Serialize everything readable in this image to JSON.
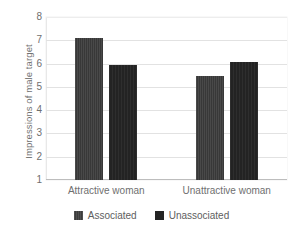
{
  "chart_data": {
    "type": "bar",
    "title": "",
    "xlabel": "",
    "ylabel": "Impressions of male target",
    "categories": [
      "Attractive woman",
      "Unattractive woman"
    ],
    "series": [
      {
        "name": "Associated",
        "values": [
          7.1,
          5.45
        ],
        "color": "#383838"
      },
      {
        "name": "Unassociated",
        "values": [
          5.95,
          6.05
        ],
        "color": "#232323"
      }
    ],
    "ylim": [
      1,
      8
    ],
    "yticks": [
      1,
      2,
      3,
      4,
      5,
      6,
      7,
      8
    ],
    "ytick_labels": [
      "1",
      "2",
      "3",
      "4",
      "5",
      "6",
      "7",
      "8"
    ],
    "grid": "horizontal",
    "legend_position": "bottom"
  },
  "legend": {
    "items": [
      {
        "label": "Associated"
      },
      {
        "label": "Unassociated"
      }
    ]
  },
  "colors": {
    "associated": "#383838",
    "unassociated": "#232323",
    "gridline": "#e2e2e2",
    "text": "#6f6f6f",
    "background": "#ffffff"
  }
}
